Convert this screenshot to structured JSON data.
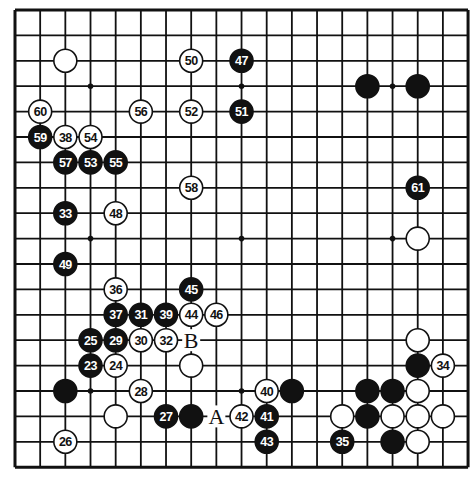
{
  "board": {
    "size": 19,
    "origin_x": 15,
    "origin_y": 10,
    "step_x": 25.17,
    "step_y": 25.4,
    "stone_radius": 11.5,
    "line_color": "#111111",
    "black_color": "#111111",
    "white_color": "#ffffff",
    "star_points": [
      [
        3,
        3
      ],
      [
        9,
        3
      ],
      [
        15,
        3
      ],
      [
        3,
        9
      ],
      [
        9,
        9
      ],
      [
        15,
        9
      ],
      [
        3,
        15
      ],
      [
        9,
        15
      ],
      [
        15,
        15
      ]
    ]
  },
  "stones": [
    {
      "c": 2,
      "r": 2,
      "color": "white",
      "num": ""
    },
    {
      "c": 7,
      "r": 2,
      "color": "white",
      "num": "50"
    },
    {
      "c": 9,
      "r": 2,
      "color": "black",
      "num": "47"
    },
    {
      "c": 14,
      "r": 3,
      "color": "black",
      "num": ""
    },
    {
      "c": 16,
      "r": 3,
      "color": "black",
      "num": ""
    },
    {
      "c": 1,
      "r": 4,
      "color": "white",
      "num": "60"
    },
    {
      "c": 5,
      "r": 4,
      "color": "white",
      "num": "56"
    },
    {
      "c": 7,
      "r": 4,
      "color": "white",
      "num": "52"
    },
    {
      "c": 9,
      "r": 4,
      "color": "black",
      "num": "51"
    },
    {
      "c": 1,
      "r": 5,
      "color": "black",
      "num": "59"
    },
    {
      "c": 2,
      "r": 5,
      "color": "white",
      "num": "38"
    },
    {
      "c": 3,
      "r": 5,
      "color": "white",
      "num": "54"
    },
    {
      "c": 2,
      "r": 6,
      "color": "black",
      "num": "57"
    },
    {
      "c": 3,
      "r": 6,
      "color": "black",
      "num": "53"
    },
    {
      "c": 4,
      "r": 6,
      "color": "black",
      "num": "55"
    },
    {
      "c": 7,
      "r": 7,
      "color": "white",
      "num": "58"
    },
    {
      "c": 16,
      "r": 7,
      "color": "black",
      "num": "61"
    },
    {
      "c": 2,
      "r": 8,
      "color": "black",
      "num": "33"
    },
    {
      "c": 4,
      "r": 8,
      "color": "white",
      "num": "48"
    },
    {
      "c": 16,
      "r": 9,
      "color": "white",
      "num": ""
    },
    {
      "c": 2,
      "r": 10,
      "color": "black",
      "num": "49"
    },
    {
      "c": 4,
      "r": 11,
      "color": "white",
      "num": "36"
    },
    {
      "c": 7,
      "r": 11,
      "color": "black",
      "num": "45"
    },
    {
      "c": 4,
      "r": 12,
      "color": "black",
      "num": "37"
    },
    {
      "c": 5,
      "r": 12,
      "color": "black",
      "num": "31"
    },
    {
      "c": 6,
      "r": 12,
      "color": "black",
      "num": "39"
    },
    {
      "c": 7,
      "r": 12,
      "color": "white",
      "num": "44"
    },
    {
      "c": 8,
      "r": 12,
      "color": "white",
      "num": "46"
    },
    {
      "c": 3,
      "r": 13,
      "color": "black",
      "num": "25"
    },
    {
      "c": 4,
      "r": 13,
      "color": "black",
      "num": "29"
    },
    {
      "c": 5,
      "r": 13,
      "color": "white",
      "num": "30"
    },
    {
      "c": 6,
      "r": 13,
      "color": "white",
      "num": "32"
    },
    {
      "c": 16,
      "r": 13,
      "color": "white",
      "num": ""
    },
    {
      "c": 3,
      "r": 14,
      "color": "black",
      "num": "23"
    },
    {
      "c": 4,
      "r": 14,
      "color": "white",
      "num": "24"
    },
    {
      "c": 7,
      "r": 14,
      "color": "white",
      "num": ""
    },
    {
      "c": 16,
      "r": 14,
      "color": "black",
      "num": ""
    },
    {
      "c": 17,
      "r": 14,
      "color": "white",
      "num": "34"
    },
    {
      "c": 2,
      "r": 15,
      "color": "black",
      "num": ""
    },
    {
      "c": 5,
      "r": 15,
      "color": "white",
      "num": "28"
    },
    {
      "c": 10,
      "r": 15,
      "color": "white",
      "num": "40"
    },
    {
      "c": 11,
      "r": 15,
      "color": "black",
      "num": ""
    },
    {
      "c": 14,
      "r": 15,
      "color": "black",
      "num": ""
    },
    {
      "c": 15,
      "r": 15,
      "color": "black",
      "num": ""
    },
    {
      "c": 16,
      "r": 15,
      "color": "white",
      "num": ""
    },
    {
      "c": 4,
      "r": 16,
      "color": "white",
      "num": ""
    },
    {
      "c": 6,
      "r": 16,
      "color": "black",
      "num": "27"
    },
    {
      "c": 7,
      "r": 16,
      "color": "black",
      "num": ""
    },
    {
      "c": 9,
      "r": 16,
      "color": "white",
      "num": "42"
    },
    {
      "c": 10,
      "r": 16,
      "color": "black",
      "num": "41"
    },
    {
      "c": 13,
      "r": 16,
      "color": "white",
      "num": ""
    },
    {
      "c": 14,
      "r": 16,
      "color": "black",
      "num": ""
    },
    {
      "c": 15,
      "r": 16,
      "color": "white",
      "num": ""
    },
    {
      "c": 16,
      "r": 16,
      "color": "white",
      "num": ""
    },
    {
      "c": 17,
      "r": 16,
      "color": "white",
      "num": ""
    },
    {
      "c": 2,
      "r": 17,
      "color": "white",
      "num": "26"
    },
    {
      "c": 10,
      "r": 17,
      "color": "black",
      "num": "43"
    },
    {
      "c": 13,
      "r": 17,
      "color": "black",
      "num": "35"
    },
    {
      "c": 15,
      "r": 17,
      "color": "black",
      "num": ""
    },
    {
      "c": 16,
      "r": 17,
      "color": "white",
      "num": ""
    }
  ],
  "labels": [
    {
      "c": 7,
      "r": 13,
      "text": "B"
    },
    {
      "c": 8,
      "r": 16,
      "text": "A"
    }
  ]
}
